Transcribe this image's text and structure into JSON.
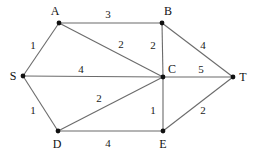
{
  "figure": {
    "background_color": "#ffffff",
    "edge_color": "#6b6b6b",
    "node_color": "#111111",
    "text_color": "#111111",
    "width": 257,
    "height": 157
  },
  "chart_data": {
    "type": "diagram",
    "title": "",
    "xlabel": "",
    "ylabel": "",
    "layout": "undirected weighted graph, nodes drawn as filled dots with letter labels",
    "nodes": [
      {
        "id": "S",
        "label": "S",
        "x": 23,
        "y": 76,
        "label_x": 13,
        "label_y": 76
      },
      {
        "id": "A",
        "label": "A",
        "x": 59,
        "y": 23,
        "label_x": 55,
        "label_y": 11
      },
      {
        "id": "B",
        "label": "B",
        "x": 162,
        "y": 23,
        "label_x": 168,
        "label_y": 11
      },
      {
        "id": "C",
        "label": "C",
        "x": 163,
        "y": 77,
        "label_x": 172,
        "label_y": 69
      },
      {
        "id": "D",
        "label": "D",
        "x": 58,
        "y": 131,
        "label_x": 57,
        "label_y": 144
      },
      {
        "id": "E",
        "label": "E",
        "x": 163,
        "y": 131,
        "label_x": 163,
        "label_y": 144
      },
      {
        "id": "T",
        "label": "T",
        "x": 233,
        "y": 77,
        "label_x": 243,
        "label_y": 77
      }
    ],
    "edges": [
      {
        "from": "S",
        "to": "A",
        "weight": 1,
        "label": "1",
        "label_x": 33,
        "label_y": 45
      },
      {
        "from": "A",
        "to": "B",
        "weight": 3,
        "label": "3",
        "label_x": 108,
        "label_y": 14
      },
      {
        "from": "A",
        "to": "C",
        "weight": 2,
        "label": "2",
        "label_x": 121,
        "label_y": 44
      },
      {
        "from": "S",
        "to": "C",
        "weight": 4,
        "label": "4",
        "label_x": 81,
        "label_y": 69
      },
      {
        "from": "B",
        "to": "C",
        "weight": 2,
        "label": "2",
        "label_x": 153,
        "label_y": 45
      },
      {
        "from": "B",
        "to": "T",
        "weight": 4,
        "label": "4",
        "label_x": 203,
        "label_y": 45
      },
      {
        "from": "C",
        "to": "T",
        "weight": 5,
        "label": "5",
        "label_x": 201,
        "label_y": 69
      },
      {
        "from": "S",
        "to": "D",
        "weight": 1,
        "label": "1",
        "label_x": 33,
        "label_y": 110
      },
      {
        "from": "D",
        "to": "C",
        "weight": 2,
        "label": "2",
        "label_x": 99,
        "label_y": 98
      },
      {
        "from": "D",
        "to": "E",
        "weight": 4,
        "label": "4",
        "label_x": 108,
        "label_y": 143
      },
      {
        "from": "C",
        "to": "E",
        "weight": 1,
        "label": "1",
        "label_x": 153,
        "label_y": 110
      },
      {
        "from": "E",
        "to": "T",
        "weight": 2,
        "label": "2",
        "label_x": 203,
        "label_y": 110
      }
    ]
  }
}
